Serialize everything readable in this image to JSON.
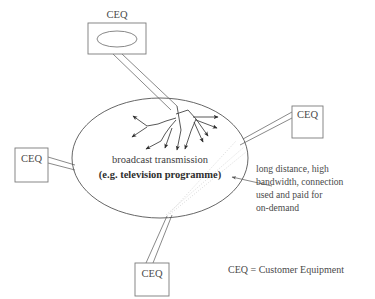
{
  "diagram": {
    "nodes": [
      {
        "id": "ceq-top",
        "label": "CEQ",
        "has_screen_icon": true,
        "x": 88,
        "y": 23,
        "w": 58,
        "h": 31
      },
      {
        "id": "ceq-right",
        "label": "CEQ",
        "has_screen_icon": false,
        "x": 292,
        "y": 106,
        "w": 31,
        "h": 32
      },
      {
        "id": "ceq-left",
        "label": "CEQ",
        "has_screen_icon": false,
        "x": 15,
        "y": 148,
        "w": 33,
        "h": 34
      },
      {
        "id": "ceq-bottom",
        "label": "CEQ",
        "has_screen_icon": false,
        "x": 135,
        "y": 263,
        "w": 34,
        "h": 33
      }
    ],
    "cloud": {
      "label_line1": "broadcast transmission",
      "label_line2": "(e.g. television programme)",
      "cx": 160,
      "cy": 158,
      "rx": 88,
      "ry": 60
    },
    "annotation": {
      "lines": [
        "long distance, high",
        "bandwidth, connection",
        "used and paid for",
        "on-demand"
      ]
    },
    "legend": {
      "text": "CEQ = Customer Equipment"
    },
    "colors": {
      "background": "#ffffff",
      "line": "#6b6b6b",
      "text": "#3a3a3a",
      "faint": "#c8c8c8"
    }
  }
}
